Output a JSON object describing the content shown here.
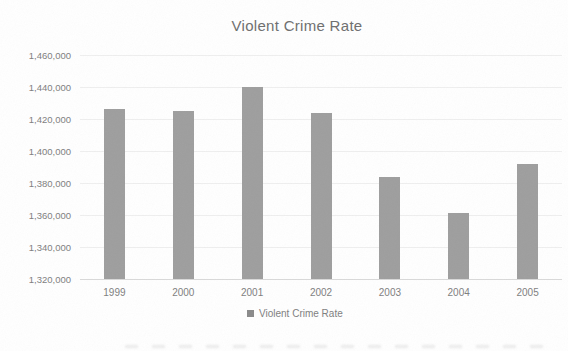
{
  "chart_data": {
    "type": "bar",
    "title": "Violent Crime Rate",
    "categories": [
      "1999",
      "2000",
      "2001",
      "2002",
      "2003",
      "2004",
      "2005"
    ],
    "values": [
      1426000,
      1425000,
      1440000,
      1424000,
      1384000,
      1361000,
      1392000
    ],
    "xlabel": "",
    "ylabel": "",
    "ylim": [
      1320000,
      1460000
    ],
    "ytick_step": 20000,
    "ytick_labels": [
      "1,320,000",
      "1,340,000",
      "1,360,000",
      "1,380,000",
      "1,400,000",
      "1,420,000",
      "1,440,000",
      "1,460,000"
    ],
    "grid": true,
    "legend": {
      "position": "bottom",
      "entries": [
        "Violent Crime Rate"
      ]
    },
    "colors": {
      "bar": "#9e9e9e",
      "legend_marker": "#8a8a8a",
      "title_text": "#6e6e6e",
      "axis_text": "#7e7e7e",
      "gridline": "#efefef",
      "axis_line": "#d9d9d9",
      "background": "#ffffff"
    }
  }
}
